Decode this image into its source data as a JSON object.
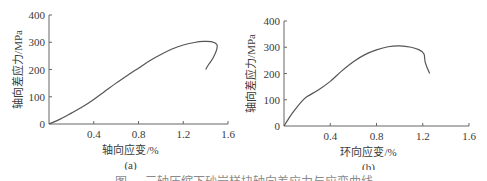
{
  "chart_data": [
    {
      "type": "line",
      "panel_label": "(a)",
      "title": "",
      "xlabel": "轴向应变/%",
      "ylabel": "轴向差应力/MPa",
      "xlim": [
        0,
        1.6
      ],
      "ylim": [
        0,
        400
      ],
      "xticks": [
        "0.4",
        "0.8",
        "1.2",
        "1.6"
      ],
      "yticks": [
        "0",
        "100",
        "200",
        "300",
        "400"
      ],
      "grid": false,
      "legend": null,
      "series": [
        {
          "name": "axial stress-strain",
          "x": [
            0,
            0.1,
            0.2,
            0.3,
            0.4,
            0.5,
            0.6,
            0.7,
            0.8,
            0.9,
            1.0,
            1.1,
            1.2,
            1.3,
            1.38,
            1.45,
            1.5,
            1.5,
            1.47,
            1.43,
            1.4
          ],
          "y": [
            0,
            18,
            40,
            63,
            90,
            120,
            150,
            178,
            205,
            232,
            255,
            275,
            290,
            299,
            303,
            302,
            292,
            275,
            245,
            220,
            200
          ]
        }
      ]
    },
    {
      "type": "line",
      "panel_label": "(b)",
      "title": "",
      "xlabel": "环向应变/%",
      "ylabel": "轴向差应力/MPa",
      "xlim": [
        0,
        1.6
      ],
      "ylim": [
        0,
        400
      ],
      "xticks": [
        "0.4",
        "0.8",
        "1.2",
        "1.6"
      ],
      "yticks": [
        "0",
        "100",
        "200",
        "300",
        "400"
      ],
      "grid": false,
      "legend": null,
      "series": [
        {
          "name": "hoop stress-strain",
          "x": [
            0,
            0.05,
            0.1,
            0.15,
            0.2,
            0.3,
            0.4,
            0.5,
            0.6,
            0.7,
            0.8,
            0.9,
            1.0,
            1.1,
            1.17,
            1.21,
            1.22,
            1.24,
            1.26
          ],
          "y": [
            0,
            35,
            65,
            92,
            112,
            138,
            170,
            210,
            245,
            272,
            290,
            302,
            305,
            300,
            290,
            275,
            245,
            220,
            200
          ]
        }
      ]
    }
  ],
  "figure": {
    "panel_a": {
      "label": "(a)",
      "xlabel": "轴向应变/%",
      "ylabel": "轴向差应力/MPa",
      "origin_label": "0"
    },
    "panel_b": {
      "label": "(b)",
      "xlabel": "环向应变/%",
      "ylabel": "轴向差应力/MPa",
      "origin_label": "0"
    },
    "caption": "图 … 三轴压缩下砂岩样块轴向差应力与应变曲线",
    "line_color": "#555555",
    "axis_color": "#666666"
  }
}
